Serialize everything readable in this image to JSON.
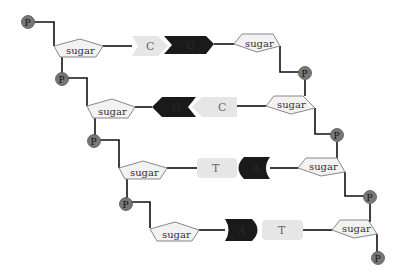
{
  "diagram": {
    "title": "",
    "phosphate_label": "P",
    "sugar_label": "sugar",
    "colors": {
      "phosphate": "#777777",
      "sugar_fill": "#f2f2f2",
      "light_base": "#e6e6e6",
      "dark_base": "#1a1a1a",
      "line": "#111111"
    },
    "base_pairs": [
      {
        "left": "C",
        "right": "G",
        "left_shade": "light",
        "right_shade": "dark",
        "shape": "arrow"
      },
      {
        "left": "G",
        "right": "C",
        "left_shade": "dark",
        "right_shade": "light",
        "shape": "arrow"
      },
      {
        "left": "T",
        "right": "A",
        "left_shade": "light",
        "right_shade": "dark",
        "shape": "round"
      },
      {
        "left": "A",
        "right": "T",
        "left_shade": "dark",
        "right_shade": "light",
        "shape": "round"
      }
    ]
  }
}
